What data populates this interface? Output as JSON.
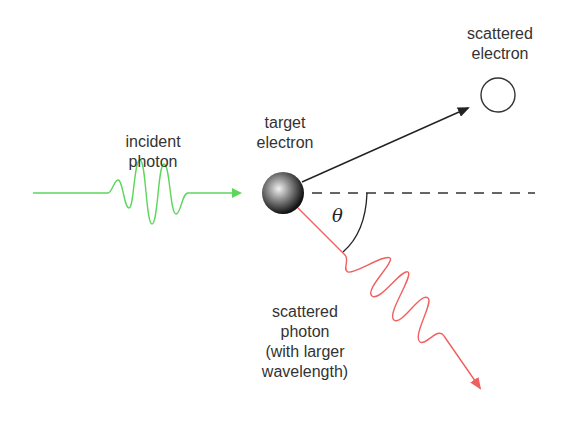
{
  "diagram": {
    "labels": {
      "incident_photon": "incident\nphoton",
      "target_electron": "target\nelectron",
      "scattered_electron": "scattered\nelectron",
      "scattered_photon": "scattered\nphoton\n(with larger\nwavelength)",
      "angle": "θ"
    },
    "colors": {
      "incident_photon": "#5cd65c",
      "scattered_photon": "#f06060",
      "electron_path": "#222222",
      "reference_line": "#333333",
      "text": "#333333"
    }
  }
}
